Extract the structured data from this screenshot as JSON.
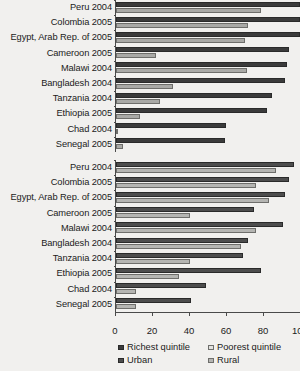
{
  "chart_data": [
    {
      "type": "bar",
      "title": "",
      "orientation": "horizontal",
      "xlabel": "",
      "ylabel": "",
      "xlim": [
        0,
        100
      ],
      "xticks": [
        0,
        20,
        40,
        60,
        80,
        100
      ],
      "grid": false,
      "legend_position": "bottom",
      "categories": [
        "Peru 2004",
        "Colombia 2005",
        "Egypt, Arab Rep. of 2005",
        "Cameroon 2005",
        "Malawi 2004",
        "Bangladesh 2004",
        "Tanzania 2004",
        "Ethiopia 2005",
        "Chad 2004",
        "Senegal 2005"
      ],
      "series": [
        {
          "name": "Richest quintile",
          "color": "#3b3b3b",
          "values": [
            100,
            100,
            100,
            94,
            93,
            92,
            85,
            82,
            60,
            59
          ]
        },
        {
          "name": "Poorest quintile",
          "color": "#a9a9a6",
          "values": [
            79,
            72,
            70,
            22,
            71,
            31,
            24,
            13,
            1,
            4
          ]
        }
      ]
    },
    {
      "type": "bar",
      "title": "",
      "orientation": "horizontal",
      "xlabel": "",
      "ylabel": "",
      "xlim": [
        0,
        100
      ],
      "xticks": [
        0,
        20,
        40,
        60,
        80,
        100
      ],
      "grid": false,
      "legend_position": "bottom",
      "categories": [
        "Peru 2004",
        "Colombia 2005",
        "Egypt, Arab Rep. of 2005",
        "Cameroon 2005",
        "Malawi 2004",
        "Bangladesh 2004",
        "Tanzania 2004",
        "Ethiopia 2005",
        "Chad 2004",
        "Senegal 2005"
      ],
      "series": [
        {
          "name": "Urban",
          "color": "#4d4d4d",
          "values": [
            97,
            94,
            92,
            75,
            91,
            72,
            69,
            79,
            49,
            41
          ]
        },
        {
          "name": "Rural",
          "color": "#b5b5b2",
          "values": [
            87,
            76,
            83,
            40,
            76,
            68,
            40,
            34,
            11,
            11
          ]
        }
      ]
    }
  ],
  "legend": {
    "items": [
      {
        "label": "Richest quintile",
        "swatch": "sw0"
      },
      {
        "label": "Poorest quintile",
        "swatch": "sw1"
      },
      {
        "label": "Urban",
        "swatch": "sw2"
      },
      {
        "label": "Rural",
        "swatch": "sw3"
      }
    ]
  }
}
